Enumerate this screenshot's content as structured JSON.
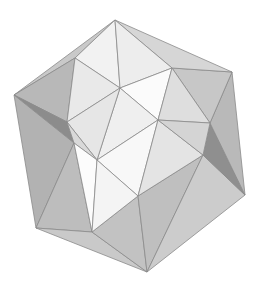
{
  "canvas": {
    "width": 261,
    "height": 292,
    "background": "#ffffff",
    "title": "shaded polyhedron render"
  },
  "render": {
    "object_name": "icosahedron",
    "shading": "flat",
    "edge_color": "#8a8a8a",
    "edge_width": 0.8,
    "palette": {
      "highlight": "#fdfdfd",
      "bright": "#f6f6f6",
      "light": "#ededed",
      "light_mid": "#e2e2e2",
      "mid": "#d2d2d2",
      "mid_gray": "#c4c4c4",
      "gray": "#b6b6b6",
      "dark_gray": "#a6a6a6",
      "dark": "#989898",
      "darker": "#8c8c8c",
      "darkest": "#7e7e7e"
    }
  },
  "geometry": {
    "vertices": {
      "top_apex": [
        115,
        20
      ],
      "left_vertex": [
        14,
        95
      ],
      "right_vertex": [
        232,
        72
      ],
      "bottom_left": [
        36,
        228
      ],
      "bottom_apex": [
        147,
        272
      ],
      "bottom_right": [
        245,
        195
      ],
      "ridge_upper_left": [
        75,
        58
      ],
      "ridge_upper_right": [
        172,
        68
      ],
      "node_center_left": [
        74,
        143
      ],
      "node_center_right": [
        203,
        155
      ],
      "node_mid_left": [
        67,
        122
      ],
      "node_mid_right": [
        210,
        123
      ],
      "inner_top": [
        120,
        88
      ],
      "inner_upper_mid": [
        158,
        120
      ],
      "inner_lower_mid": [
        97,
        160
      ],
      "inner_bottom": [
        138,
        196
      ],
      "bottom_bright": [
        92,
        232
      ],
      "left_bulge": [
        40,
        118
      ],
      "right_bulge": [
        218,
        140
      ]
    },
    "faces": [
      {
        "id": "f01",
        "name": "top-left-upper",
        "points": "115,20 75,58 14,95",
        "fill": "#c9c9c9"
      },
      {
        "id": "f02",
        "name": "top-left-ridge",
        "points": "75,58 67,122 14,95",
        "fill": "#b8b8b8"
      },
      {
        "id": "f03",
        "name": "left-dark-triangle",
        "points": "14,95 67,122 74,143",
        "fill": "#8c8c8c"
      },
      {
        "id": "f04",
        "name": "left-lower-body",
        "points": "14,95 74,143 36,228",
        "fill": "#b2b2b2"
      },
      {
        "id": "f05",
        "name": "left-bottom-wedge",
        "points": "74,143 92,232 36,228",
        "fill": "#bdbdbd"
      },
      {
        "id": "f06",
        "name": "bottom-left-base",
        "points": "36,228 92,232 147,272",
        "fill": "#c9c9c9"
      },
      {
        "id": "f07",
        "name": "bottom-center-base",
        "points": "92,232 138,196 147,272",
        "fill": "#c2c2c2"
      },
      {
        "id": "f08",
        "name": "bottom-right-base",
        "points": "138,196 203,155 147,272",
        "fill": "#bfbfbf"
      },
      {
        "id": "f09",
        "name": "bottom-right-edge",
        "points": "203,155 245,195 147,272",
        "fill": "#cccccc"
      },
      {
        "id": "f10",
        "name": "right-dark-triangle",
        "points": "203,155 210,123 245,195",
        "fill": "#8f8f8f"
      },
      {
        "id": "f11",
        "name": "right-upper-body",
        "points": "210,123 232,72 245,195",
        "fill": "#b9b9b9"
      },
      {
        "id": "f12",
        "name": "right-top-panel",
        "points": "172,68 232,72 210,123",
        "fill": "#c7c7c7"
      },
      {
        "id": "f13",
        "name": "top-right-upper",
        "points": "115,20 172,68 232,72",
        "fill": "#d6d6d6"
      },
      {
        "id": "f14",
        "name": "top-bright-face",
        "points": "115,20 75,58 120,88",
        "fill": "#f2f2f2"
      },
      {
        "id": "f15",
        "name": "top-center-bright",
        "points": "115,20 120,88 172,68",
        "fill": "#ededed"
      },
      {
        "id": "f16",
        "name": "upper-left-bright",
        "points": "75,58 67,122 120,88",
        "fill": "#e9e9e9"
      },
      {
        "id": "f17",
        "name": "inner-upper-right",
        "points": "120,88 172,68 158,120",
        "fill": "#fbfbfb"
      },
      {
        "id": "f18",
        "name": "inner-right-panel",
        "points": "172,68 210,123 158,120",
        "fill": "#dedede"
      },
      {
        "id": "f19",
        "name": "inner-center-upper",
        "points": "120,88 158,120 97,160",
        "fill": "#efefef"
      },
      {
        "id": "f20",
        "name": "inner-center-left",
        "points": "67,122 120,88 97,160",
        "fill": "#e6e6e6"
      },
      {
        "id": "f21",
        "name": "inner-left-node",
        "points": "67,122 97,160 74,143",
        "fill": "#d9d9d9"
      },
      {
        "id": "f22",
        "name": "inner-center-lower",
        "points": "97,160 158,120 138,196",
        "fill": "#f8f8f8"
      },
      {
        "id": "f23",
        "name": "inner-right-lower",
        "points": "158,120 203,155 138,196",
        "fill": "#e4e4e4"
      },
      {
        "id": "f24",
        "name": "inner-right-mid",
        "points": "158,120 210,123 203,155",
        "fill": "#d4d4d4"
      },
      {
        "id": "f25",
        "name": "inner-bottom-bright",
        "points": "74,143 97,160 92,232",
        "fill": "#fcfcfc"
      },
      {
        "id": "f26",
        "name": "inner-bottom-right-bright",
        "points": "97,160 138,196 92,232",
        "fill": "#f4f4f4"
      }
    ]
  }
}
